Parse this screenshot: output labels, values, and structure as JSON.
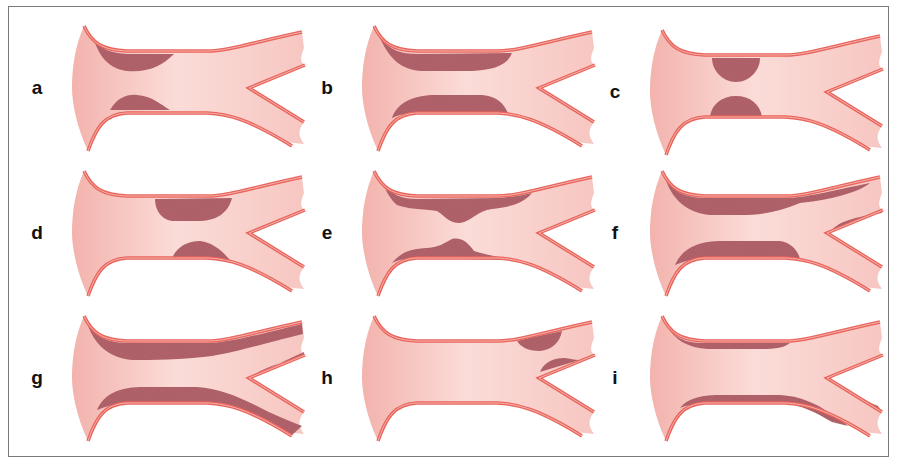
{
  "figure": {
    "colors": {
      "lumen": "#f6c2bd",
      "lumen_light": "#fbdcd8",
      "wall": "#e8645c",
      "wall_inner": "#f4a49c",
      "plaque": "#b0626a",
      "frame": "#7a7a7a",
      "label": "#111111"
    },
    "panels": [
      {
        "label": "a",
        "pattern": "focal-proximal-common",
        "row": 0,
        "col": 0
      },
      {
        "label": "b",
        "pattern": "long-segment-common",
        "row": 0,
        "col": 1
      },
      {
        "label": "c",
        "pattern": "focal-mid-common",
        "row": 0,
        "col": 2
      },
      {
        "label": "d",
        "pattern": "focal-distal-common",
        "row": 1,
        "col": 0
      },
      {
        "label": "e",
        "pattern": "diffuse-with-focal-stenosis",
        "row": 1,
        "col": 1
      },
      {
        "label": "f",
        "pattern": "diffuse-common-extending-upper-branch",
        "row": 1,
        "col": 2
      },
      {
        "label": "g",
        "pattern": "diffuse-common-and-both-branches",
        "row": 2,
        "col": 0
      },
      {
        "label": "h",
        "pattern": "focal-upper-branch",
        "row": 2,
        "col": 1
      },
      {
        "label": "i",
        "pattern": "thin-diffuse-wall-and-lower-branch",
        "row": 2,
        "col": 2
      }
    ]
  }
}
